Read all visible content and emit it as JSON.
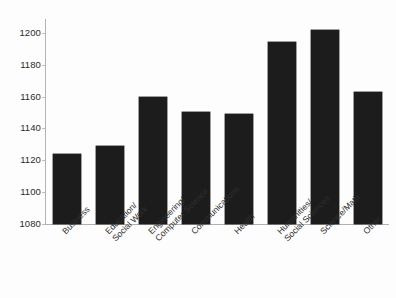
{
  "chart_data": {
    "type": "bar",
    "title": "",
    "subtitle": "",
    "xlabel": "",
    "ylabel": "",
    "categories": [
      "Business",
      "Education/\nSocial Work",
      "Engineering/\nComputer Science",
      "Communications",
      "Health",
      "Humanities/\nSocial Sciences",
      "Science/Math",
      "Other"
    ],
    "values": [
      1124,
      1129,
      1160,
      1150,
      1149,
      1194,
      1202,
      1163
    ],
    "ylim": [
      1080,
      1208
    ],
    "yticks": [
      1080,
      1100,
      1120,
      1140,
      1160,
      1180,
      1200
    ],
    "ytick_labels": [
      "1080",
      "1100",
      "1120",
      "1140",
      "1160",
      "1180",
      "1200"
    ],
    "grid": false,
    "legend": null,
    "legend_position": "none",
    "bar_color": "#1c1c1c",
    "axis_color": "#b4b4b4",
    "background_color": "#fdfdfd",
    "text_color": "#2b2b2b",
    "xtick_rotation": -45
  }
}
